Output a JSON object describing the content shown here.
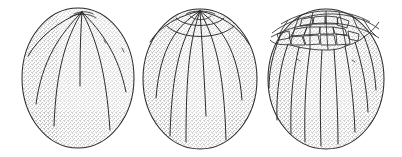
{
  "figure": {
    "type": "scientific-illustration",
    "description": "Three successive cleavage stages of an ovoid egg drawn in stippled pen-and-ink, viewed from the side with the animal pole uppermost.",
    "background_color": "#ffffff",
    "ink_color": "#2b2b2b",
    "stipple_color": "#8d8d8d",
    "fill_color": "#fdfdfd",
    "panel_count": 3,
    "panels": [
      {
        "id": "stage-1",
        "name": "early-meridional-cleavage",
        "label": "",
        "outline": {
          "center_x": 78,
          "center_y": 78,
          "radius_x": 56,
          "radius_y": 70
        },
        "meridional_furrow_count": 6,
        "latitudinal_furrow_count": 0,
        "polygonal_cap_cells": 0,
        "apex_x": 82,
        "apex_y": 12
      },
      {
        "id": "stage-2",
        "name": "meridional-plus-latitudinal-cleavage",
        "label": "",
        "outline": {
          "center_x": 200,
          "center_y": 79,
          "radius_x": 57,
          "radius_y": 70
        },
        "meridional_furrow_count": 8,
        "latitudinal_furrow_count": 2,
        "polygonal_cap_cells": 0,
        "apex_x": 200,
        "apex_y": 11
      },
      {
        "id": "stage-3",
        "name": "micromere-cap-stage",
        "label": "",
        "outline": {
          "center_x": 326,
          "center_y": 79,
          "radius_x": 58,
          "radius_y": 70
        },
        "meridional_furrow_count": 9,
        "latitudinal_furrow_count": 0,
        "polygonal_cap_cells": 34,
        "apex_x": 326,
        "apex_y": 11
      }
    ]
  }
}
